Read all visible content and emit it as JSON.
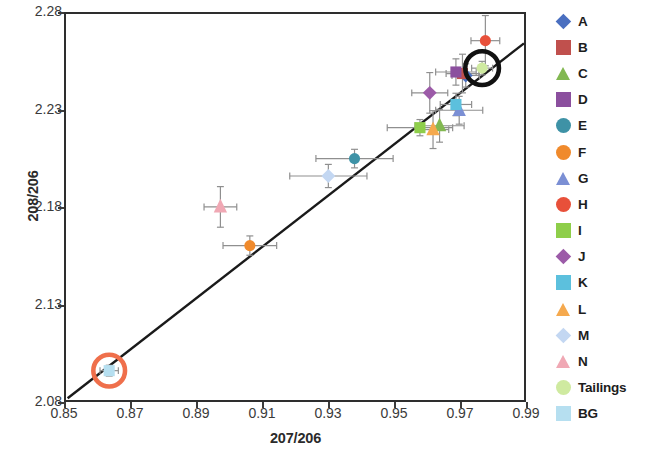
{
  "chart_data": {
    "type": "scatter",
    "title": "",
    "xlabel": "207/206",
    "ylabel": "208/206",
    "xlim": [
      0.85,
      0.99
    ],
    "ylim": [
      2.08,
      2.28
    ],
    "xticks": [
      "0.85",
      "0.87",
      "0.89",
      "0.91",
      "0.93",
      "0.95",
      "0.97",
      "0.99"
    ],
    "xtick_values": [
      0.85,
      0.87,
      0.89,
      0.91,
      0.93,
      0.95,
      0.97,
      0.99
    ],
    "yticks": [
      "2.08",
      "2.13",
      "2.18",
      "2.23",
      "2.28"
    ],
    "ytick_values": [
      2.08,
      2.13,
      2.18,
      2.23,
      2.28
    ],
    "grid": false,
    "legend_position": "right",
    "error_bars": true,
    "trendline": {
      "x0": 0.8505,
      "y0": 2.0812,
      "x1": 0.99,
      "y1": 2.2648,
      "color": "#1a1a1a"
    },
    "highlights": [
      {
        "label": "BG",
        "x": 0.8632,
        "y": 2.0955,
        "ring_color": "#ef6f4b",
        "radius_px": 16
      },
      {
        "label": "Tailings",
        "x": 0.9772,
        "y": 2.252,
        "ring_color": "#111111",
        "radius_px": 17
      }
    ],
    "series": [
      {
        "name": "A",
        "marker": "diamond",
        "color": "#4a6fc0",
        "x": 0.9722,
        "y": 2.2482,
        "xerr": 0.0042,
        "yerr": 0.006
      },
      {
        "name": "B",
        "marker": "square",
        "color": "#c0504d",
        "x": 0.9712,
        "y": 2.2492,
        "xerr": 0.005,
        "yerr": 0.01
      },
      {
        "name": "C",
        "marker": "triangle",
        "color": "#82b852",
        "x": 0.9642,
        "y": 2.2222,
        "xerr": 0.0075,
        "yerr": 0.0085
      },
      {
        "name": "D",
        "marker": "square",
        "color": "#8b4f9e",
        "x": 0.9692,
        "y": 2.25,
        "xerr": 0.0062,
        "yerr": 0.0068
      },
      {
        "name": "E",
        "marker": "circle",
        "color": "#3e92a6",
        "x": 0.9382,
        "y": 2.2052,
        "xerr": 0.0118,
        "yerr": 0.0048
      },
      {
        "name": "F",
        "marker": "circle",
        "color": "#f08a2c",
        "x": 0.9062,
        "y": 2.1602,
        "xerr": 0.0082,
        "yerr": 0.005
      },
      {
        "name": "G",
        "marker": "triangle",
        "color": "#7b8fd4",
        "x": 0.9702,
        "y": 2.2302,
        "xerr": 0.0072,
        "yerr": 0.0072
      },
      {
        "name": "H",
        "marker": "circle",
        "color": "#e8503a",
        "x": 0.9782,
        "y": 2.2662,
        "xerr": 0.0044,
        "yerr": 0.013
      },
      {
        "name": "I",
        "marker": "square",
        "color": "#8ece4a",
        "x": 0.9582,
        "y": 2.2212,
        "xerr": 0.01,
        "yerr": 0.0042
      },
      {
        "name": "J",
        "marker": "diamond",
        "color": "#9c5ba8",
        "x": 0.9612,
        "y": 2.2392,
        "xerr": 0.0055,
        "yerr": 0.0105
      },
      {
        "name": "K",
        "marker": "square",
        "color": "#5cc0dd",
        "x": 0.9692,
        "y": 2.2332,
        "xerr": 0.0048,
        "yerr": 0.0058
      },
      {
        "name": "L",
        "marker": "triangle",
        "color": "#f5a94e",
        "x": 0.9622,
        "y": 2.2202,
        "xerr": 0.0048,
        "yerr": 0.0098
      },
      {
        "name": "M",
        "marker": "diamond",
        "color": "#c3d7f2",
        "x": 0.9302,
        "y": 2.1962,
        "xerr": 0.0118,
        "yerr": 0.006
      },
      {
        "name": "N",
        "marker": "triangle",
        "color": "#f0a8b4",
        "x": 0.8972,
        "y": 2.1802,
        "xerr": 0.005,
        "yerr": 0.0105
      },
      {
        "name": "Tailings",
        "marker": "circle",
        "color": "#cfeaa0",
        "x": 0.9772,
        "y": 2.252,
        "xerr": 0.0032,
        "yerr": 0.0035
      },
      {
        "name": "BG",
        "marker": "square",
        "color": "#b6dff0",
        "x": 0.8632,
        "y": 2.0955,
        "xerr": 0.0028,
        "yerr": 0.0028
      }
    ]
  },
  "legend": {
    "items": [
      {
        "label": "A",
        "marker": "diamond",
        "color": "#4a6fc0"
      },
      {
        "label": "B",
        "marker": "square",
        "color": "#c0504d"
      },
      {
        "label": "C",
        "marker": "triangle",
        "color": "#82b852"
      },
      {
        "label": "D",
        "marker": "square",
        "color": "#8b4f9e"
      },
      {
        "label": "E",
        "marker": "circle",
        "color": "#3e92a6"
      },
      {
        "label": "F",
        "marker": "circle",
        "color": "#f08a2c"
      },
      {
        "label": "G",
        "marker": "triangle",
        "color": "#7b8fd4"
      },
      {
        "label": "H",
        "marker": "circle",
        "color": "#e8503a"
      },
      {
        "label": "I",
        "marker": "square",
        "color": "#8ece4a"
      },
      {
        "label": "J",
        "marker": "diamond",
        "color": "#9c5ba8"
      },
      {
        "label": "K",
        "marker": "square",
        "color": "#5cc0dd"
      },
      {
        "label": "L",
        "marker": "triangle",
        "color": "#f5a94e"
      },
      {
        "label": "M",
        "marker": "diamond",
        "color": "#c3d7f2"
      },
      {
        "label": "N",
        "marker": "triangle",
        "color": "#f0a8b4"
      },
      {
        "label": "Tailings",
        "marker": "circle",
        "color": "#cfeaa0"
      },
      {
        "label": "BG",
        "marker": "square",
        "color": "#b6dff0"
      }
    ]
  }
}
